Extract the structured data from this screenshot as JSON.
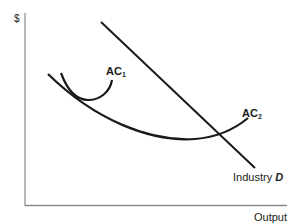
{
  "diagram": {
    "y_axis_label": "$",
    "x_axis_label": "Output",
    "curves": {
      "ac1": {
        "label": "AC",
        "subscript": "1"
      },
      "ac2": {
        "label": "AC",
        "subscript": "2"
      },
      "demand": {
        "label_prefix": "Industry ",
        "label_emph": "D"
      }
    },
    "colors": {
      "curve": "#1a1a1a",
      "axis": "#888888",
      "text": "#1a1a1a"
    }
  }
}
